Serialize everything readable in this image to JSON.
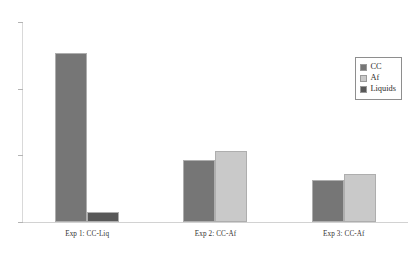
{
  "chart_data": {
    "type": "bar",
    "title": "",
    "subtitle": "",
    "xlabel": "",
    "ylabel": "",
    "grid": false,
    "legend_position": "top-right",
    "categories": [
      "Exp 1: CC-Liq",
      "Exp 2: CC-Af",
      "Exp 3: CC-Af"
    ],
    "ylim": [
      0,
      3
    ],
    "yticks": [
      0,
      1,
      2,
      3
    ],
    "ytick_labels": [
      "",
      "",
      "",
      ""
    ],
    "series": [
      {
        "name": "CC",
        "color": "#767676",
        "values": [
          2.54,
          0.93,
          0.63
        ]
      },
      {
        "name": "Af",
        "color": "#c9c9c9",
        "values": [
          null,
          1.06,
          0.72
        ]
      },
      {
        "name": "Liquids",
        "color": "#585858",
        "values": [
          0.15,
          null,
          null
        ]
      }
    ]
  },
  "legend": {
    "items": [
      {
        "label": "CC",
        "color": "#767676"
      },
      {
        "label": "Af",
        "color": "#c9c9c9"
      },
      {
        "label": "Liquids",
        "color": "#585858"
      }
    ]
  },
  "axis": {
    "categories": [
      "Exp 1: CC-Liq",
      "Exp 2: CC-Af",
      "Exp 3: CC-Af"
    ],
    "tick_labels": [
      "",
      "",
      "",
      ""
    ]
  }
}
